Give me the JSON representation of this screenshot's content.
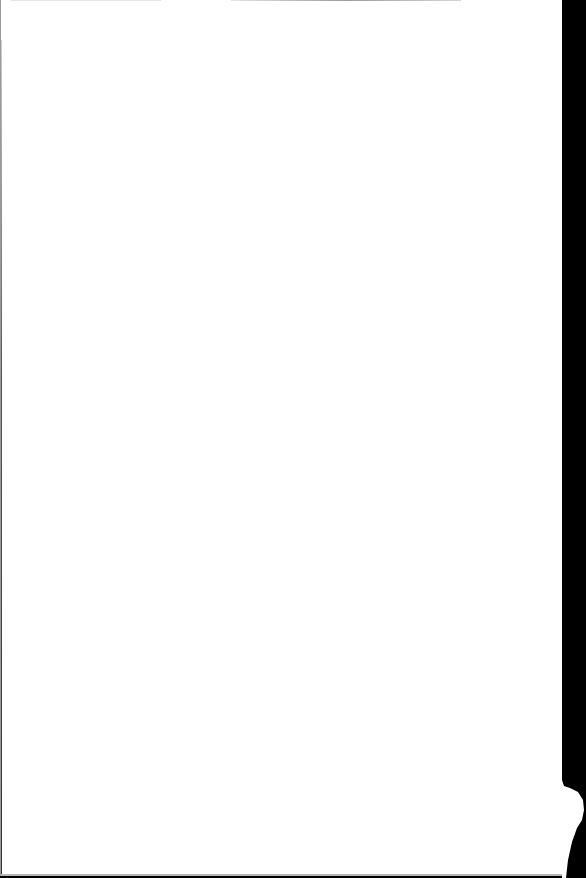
{
  "document": {
    "type": "scanned page",
    "content": "",
    "colors": {
      "page": "#ffffff",
      "scanner_background": "#000000",
      "edge_shadow": "#9a9a9a"
    }
  }
}
